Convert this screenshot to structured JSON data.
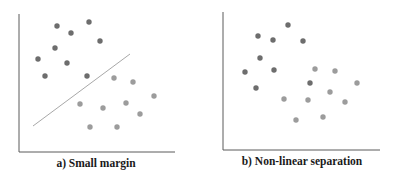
{
  "colors": {
    "class_a": "#6d6d6d",
    "class_b": "#9c9c9c",
    "axis": "#5a5a5a",
    "boundary": "#a8a8a8"
  },
  "chart_data": [
    {
      "type": "scatter",
      "title": "a) Small margin",
      "xlabel": "",
      "ylabel": "",
      "grid": false,
      "legend": null,
      "series": [
        {
          "name": "class_dark",
          "points": [
            [
              57,
              26
            ],
            [
              89,
              22
            ],
            [
              71,
              33
            ],
            [
              100,
              41
            ],
            [
              55,
              48
            ],
            [
              38,
              59
            ],
            [
              67,
              63
            ],
            [
              45,
              76
            ],
            [
              87,
              76
            ]
          ]
        },
        {
          "name": "class_light",
          "points": [
            [
              114,
              78
            ],
            [
              133,
              82
            ],
            [
              154,
              96
            ],
            [
              80,
              104
            ],
            [
              103,
              108
            ],
            [
              126,
              103
            ],
            [
              140,
              114
            ],
            [
              90,
              127
            ],
            [
              117,
              127
            ]
          ]
        }
      ],
      "decision_boundary": {
        "type": "line",
        "from": [
          33,
          126
        ],
        "to": [
          130,
          54
        ]
      }
    },
    {
      "type": "scatter",
      "title": "b) Non-linear separation",
      "xlabel": "",
      "ylabel": "",
      "grid": false,
      "legend": null,
      "series": [
        {
          "name": "class_dark",
          "points": [
            [
              288,
              25
            ],
            [
              258,
              36
            ],
            [
              273,
              40
            ],
            [
              303,
              41
            ],
            [
              260,
              58
            ],
            [
              245,
              72
            ],
            [
              274,
              70
            ],
            [
              256,
              88
            ],
            [
              310,
              83
            ]
          ]
        },
        {
          "name": "class_light",
          "points": [
            [
              315,
              69
            ],
            [
              335,
              71
            ],
            [
              357,
              83
            ],
            [
              330,
              92
            ],
            [
              284,
              99
            ],
            [
              308,
              100
            ],
            [
              345,
              102
            ],
            [
              296,
              120
            ],
            [
              323,
              117
            ]
          ]
        }
      ],
      "decision_boundary": null
    }
  ],
  "panels": [
    {
      "caption": "a) Small margin"
    },
    {
      "caption": "b) Non-linear separation"
    }
  ]
}
